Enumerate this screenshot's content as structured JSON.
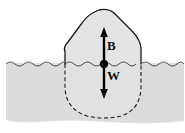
{
  "figure": {
    "type": "physics-diagram",
    "width": 185,
    "height": 133,
    "background_color": "#ffffff"
  },
  "water": {
    "name": "water-body",
    "fill_color": "#dcdcdc",
    "surface_style": "wavy-line",
    "surface_color": "#555555",
    "surface_y": 64,
    "left_x": 5,
    "right_x": 185,
    "bottom_y": 122
  },
  "object": {
    "name": "floating-rock",
    "fill_color": "#e4e4e4",
    "outline_color": "#1a1a1a",
    "above_water_style": "solid",
    "below_water_style": "dashed",
    "center_x": 104,
    "top_y": 9,
    "bottom_y": 117
  },
  "center_point": {
    "name": "center-of-mass-dot",
    "x": 104,
    "y": 64,
    "radius": 4,
    "color": "#000000"
  },
  "forces": [
    {
      "id": "buoyancy",
      "label": "B",
      "direction": "up",
      "tail_y": 64,
      "tip_y": 28,
      "x": 104,
      "color": "#000000",
      "label_x": 107,
      "label_y": 39
    },
    {
      "id": "weight",
      "label": "W",
      "direction": "down",
      "tail_y": 64,
      "tip_y": 98,
      "x": 104,
      "color": "#000000",
      "label_x": 107,
      "label_y": 69
    }
  ]
}
